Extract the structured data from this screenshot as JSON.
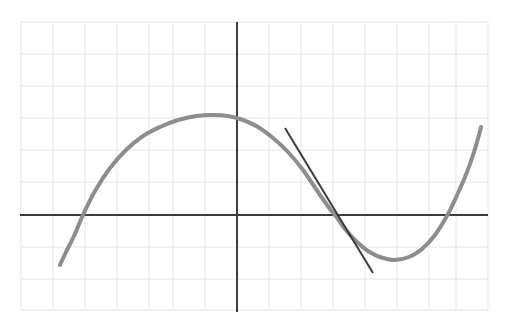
{
  "figure": {
    "title": "",
    "background_color": "#ffffff",
    "width": 512,
    "height": 321
  },
  "grid": {
    "visible": true,
    "line_color": "#e6e6e6",
    "line_width": 1,
    "x_start": 21,
    "x_end": 488,
    "y_start": 22,
    "y_end": 310,
    "spacing": 32,
    "x_lines": [
      21,
      53,
      85,
      117,
      149,
      173,
      205,
      237,
      269,
      301,
      333,
      365,
      397,
      429,
      456,
      488
    ],
    "y_lines": [
      22,
      54,
      86,
      118,
      150,
      182,
      215,
      247,
      279,
      310
    ]
  },
  "axes": {
    "x_axis": {
      "name": "x-axis",
      "color": "#3c3c3c",
      "line_width": 2,
      "y": 215,
      "x_from": 20,
      "x_to": 488,
      "label": "",
      "tick_labels": []
    },
    "y_axis": {
      "name": "y-axis",
      "color": "#3c3c3c",
      "line_width": 2,
      "x": 237,
      "y_from": 22,
      "y_to": 312,
      "label": "",
      "tick_labels": []
    }
  },
  "chart_data": {
    "type": "line",
    "title": "",
    "subtitle": "",
    "xlabel": "",
    "ylabel": "",
    "grid": true,
    "legend": "none",
    "xlim": [
      -6.75,
      7.84
    ],
    "ylim": [
      -3.0,
      6.03
    ],
    "annotations": [],
    "series": [
      {
        "name": "cubic-curve",
        "color": "#8d8d8d",
        "line_width": 4,
        "points_px": [
          [
            60,
            265
          ],
          [
            66,
            252
          ],
          [
            74,
            236
          ],
          [
            83,
            215
          ],
          [
            95,
            191
          ],
          [
            110,
            168
          ],
          [
            126,
            150
          ],
          [
            143,
            136
          ],
          [
            160,
            127
          ],
          [
            178,
            120
          ],
          [
            196,
            116
          ],
          [
            213,
            115
          ],
          [
            228,
            116
          ],
          [
            243,
            120
          ],
          [
            258,
            127
          ],
          [
            273,
            138
          ],
          [
            288,
            152
          ],
          [
            303,
            170
          ],
          [
            318,
            192
          ],
          [
            330,
            209
          ],
          [
            335,
            215
          ],
          [
            345,
            229
          ],
          [
            356,
            241
          ],
          [
            368,
            251
          ],
          [
            380,
            257
          ],
          [
            395,
            260
          ],
          [
            409,
            257
          ],
          [
            422,
            249
          ],
          [
            435,
            235
          ],
          [
            448,
            214
          ],
          [
            458,
            193
          ],
          [
            467,
            172
          ],
          [
            474,
            152
          ],
          [
            479,
            135
          ],
          [
            481,
            127
          ]
        ],
        "x": [
          -5.53,
          -5.34,
          -5.09,
          -4.81,
          -4.44,
          -3.97,
          -3.47,
          -2.94,
          -2.41,
          -1.84,
          -1.28,
          -0.75,
          -0.28,
          0.19,
          0.66,
          1.13,
          1.59,
          2.06,
          2.53,
          2.91,
          3.06,
          3.38,
          3.72,
          4.09,
          4.47,
          4.94,
          5.38,
          5.78,
          6.19,
          6.59,
          6.91,
          7.19,
          7.41,
          7.56,
          7.63
        ],
        "y": [
          -1.56,
          -1.16,
          -0.66,
          0.0,
          0.75,
          1.47,
          2.03,
          2.47,
          2.75,
          2.97,
          3.09,
          3.13,
          3.09,
          2.97,
          2.75,
          2.41,
          1.97,
          1.41,
          0.72,
          0.19,
          0.0,
          -0.44,
          -0.81,
          -1.13,
          -1.31,
          -1.41,
          -1.31,
          -1.06,
          -0.63,
          0.03,
          0.69,
          1.34,
          1.97,
          2.5,
          2.75
        ]
      },
      {
        "name": "tangent-line",
        "color": "#3c3c3c",
        "line_width": 2,
        "points_px": [
          [
            285,
            128
          ],
          [
            373,
            273
          ]
        ],
        "x": [
          1.5,
          4.25
        ],
        "y": [
          2.72,
          -1.81
        ],
        "tangent_point_px": [
          335,
          215
        ],
        "tangent_point": [
          3.06,
          0.0
        ],
        "slope": -1.65
      }
    ]
  }
}
